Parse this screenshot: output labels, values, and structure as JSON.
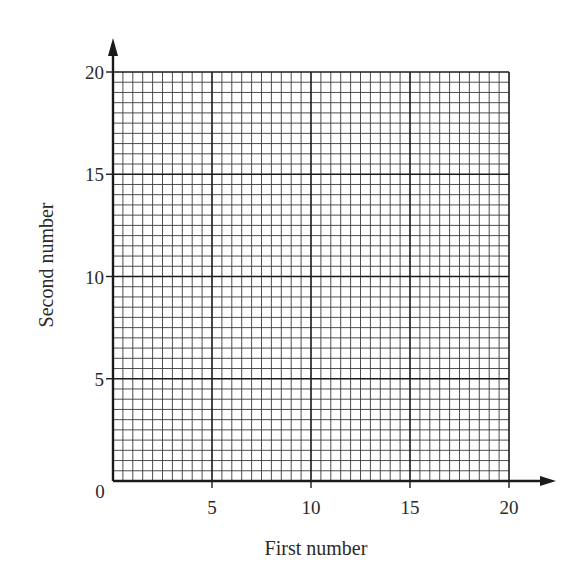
{
  "chart_data": {
    "type": "scatter",
    "title": "",
    "xlabel": "First number",
    "ylabel": "Second number",
    "xlim": [
      0,
      20
    ],
    "ylim": [
      0,
      20
    ],
    "x_ticks": [
      0,
      5,
      10,
      15,
      20
    ],
    "y_ticks": [
      0,
      5,
      10,
      15,
      20
    ],
    "x_tick_labels": [
      "0",
      "5",
      "10",
      "15",
      "20"
    ],
    "y_tick_labels": [
      "0",
      "5",
      "10",
      "15",
      "20"
    ],
    "grid": true,
    "grid_minor_step": 0.5,
    "grid_major_step": 5,
    "legend": null,
    "series": [],
    "note": "Blank graph paper grid with no plotted data"
  },
  "axes": {
    "origin_label": "0",
    "x_label": "First number",
    "y_label": "Second number"
  },
  "colors": {
    "grid_minor": "#3a3a3a",
    "grid_major": "#1a1a1a",
    "axis": "#1a1a1a",
    "background": "#ffffff"
  }
}
